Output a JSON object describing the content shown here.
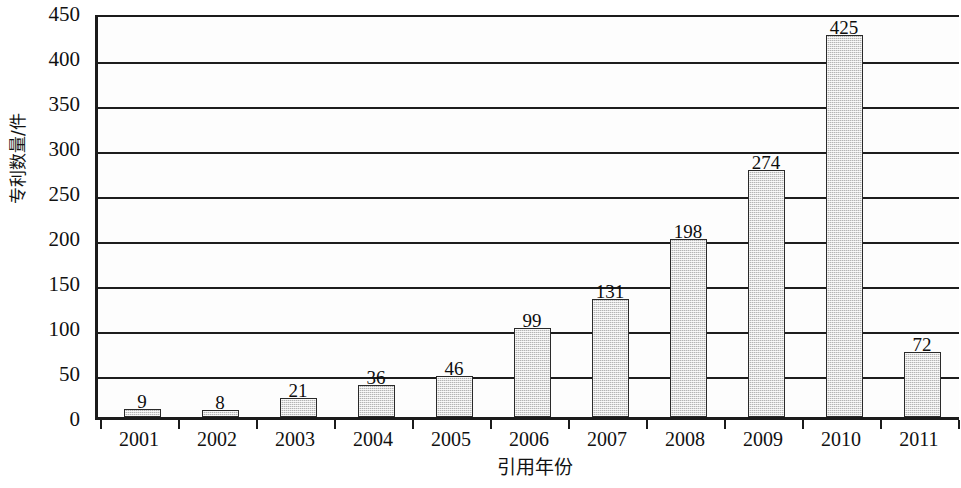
{
  "chart_data": {
    "type": "bar",
    "title": "",
    "subtitle": "",
    "xlabel": "引用年份",
    "ylabel": "专利数量/件",
    "categories": [
      "2001",
      "2002",
      "2003",
      "2004",
      "2005",
      "2006",
      "2007",
      "2008",
      "2009",
      "2010",
      "2011"
    ],
    "values": [
      9,
      8,
      21,
      36,
      46,
      99,
      131,
      198,
      274,
      425,
      72
    ],
    "data_labels": [
      "9",
      "8",
      "21",
      "36",
      "46",
      "99",
      "131",
      "198",
      "274",
      "425",
      "72"
    ],
    "ylim": [
      0,
      450
    ],
    "ytick_labels": [
      "0",
      "50",
      "100",
      "150",
      "200",
      "250",
      "300",
      "350",
      "400",
      "450"
    ],
    "ytick_values": [
      0,
      50,
      100,
      150,
      200,
      250,
      300,
      350,
      400,
      450
    ],
    "grid": true,
    "grid_axis": "y",
    "legend": null,
    "legend_position": "none",
    "bar_fill_color": "#b4b4b4",
    "bar_edge_color": "#2a2a2a",
    "axis_color": "#1b1b1b",
    "background_color": "#fdfdfd",
    "show_data_labels": true
  }
}
